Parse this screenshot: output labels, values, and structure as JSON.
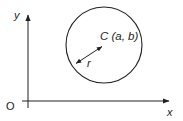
{
  "figure": {
    "name": "circle-in-cartesian-plane",
    "background_color": "#ffffff",
    "stroke_color": "#231f20",
    "width": 183,
    "height": 121
  },
  "axes": {
    "x_axis_label": "x",
    "y_axis_label": "y",
    "origin_label": "O",
    "x_axis": {
      "x1": 22,
      "y1": 101,
      "x2": 172,
      "y2": 101,
      "arrow": "right"
    },
    "y_axis": {
      "x1": 28,
      "y1": 108,
      "x2": 28,
      "y2": 12,
      "arrow": "up"
    },
    "x_label_pos": {
      "x": 168,
      "y": 115
    },
    "y_label_pos": {
      "x": 14,
      "y": 19
    },
    "origin_label_pos": {
      "x": 7,
      "y": 110
    }
  },
  "circle": {
    "center_label": "C (a, b)",
    "center_label_pos": {
      "x": 101,
      "y": 40
    },
    "center_x": 104,
    "center_y": 45,
    "radius": 38,
    "fill": "none"
  },
  "radius": {
    "label": "r",
    "label_pos": {
      "x": 87,
      "y": 66
    },
    "from": {
      "x": 74,
      "y": 65
    },
    "to": {
      "x": 104,
      "y": 45
    },
    "arrow": "both"
  }
}
